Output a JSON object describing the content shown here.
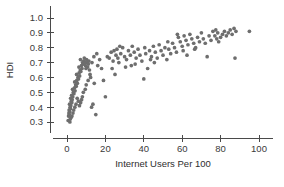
{
  "chart_data": {
    "type": "scatter",
    "title": "",
    "xlabel": "Internet Users Per 100",
    "ylabel": "HDI",
    "xlim": [
      -4,
      104
    ],
    "ylim": [
      0.28,
      1.04
    ],
    "xticks": [
      0,
      20,
      40,
      60,
      80,
      100
    ],
    "xticklabels": [
      "0",
      "20",
      "40",
      "60",
      "80",
      "100"
    ],
    "yticks": [
      0.3,
      0.4,
      0.5,
      0.6,
      0.7,
      0.8,
      0.9,
      1.0
    ],
    "yticklabels": [
      "0.3",
      "0.4",
      "0.5",
      "0.6",
      "0.7",
      "0.8",
      "0.9",
      "1.0"
    ],
    "grid": false,
    "legend": null,
    "marker": {
      "shape": "circle",
      "color": "#6e6e6e",
      "size": 2.6
    },
    "points": [
      [
        0.6,
        0.31
      ],
      [
        0.8,
        0.34
      ],
      [
        1.0,
        0.36
      ],
      [
        1.2,
        0.35
      ],
      [
        1.1,
        0.38
      ],
      [
        1.4,
        0.37
      ],
      [
        1.6,
        0.4
      ],
      [
        1.3,
        0.42
      ],
      [
        1.8,
        0.39
      ],
      [
        2.0,
        0.41
      ],
      [
        2.2,
        0.44
      ],
      [
        1.9,
        0.46
      ],
      [
        2.5,
        0.43
      ],
      [
        2.7,
        0.45
      ],
      [
        2.4,
        0.48
      ],
      [
        3.0,
        0.47
      ],
      [
        3.3,
        0.5
      ],
      [
        2.9,
        0.52
      ],
      [
        3.6,
        0.49
      ],
      [
        3.9,
        0.53
      ],
      [
        4.2,
        0.51
      ],
      [
        4.5,
        0.55
      ],
      [
        4.0,
        0.57
      ],
      [
        4.8,
        0.54
      ],
      [
        5.1,
        0.58
      ],
      [
        5.4,
        0.56
      ],
      [
        5.7,
        0.6
      ],
      [
        5.0,
        0.62
      ],
      [
        6.0,
        0.59
      ],
      [
        6.3,
        0.63
      ],
      [
        6.6,
        0.61
      ],
      [
        6.9,
        0.65
      ],
      [
        6.2,
        0.67
      ],
      [
        7.2,
        0.64
      ],
      [
        7.5,
        0.68
      ],
      [
        7.8,
        0.66
      ],
      [
        8.1,
        0.7
      ],
      [
        7.0,
        0.72
      ],
      [
        8.4,
        0.69
      ],
      [
        8.7,
        0.71
      ],
      [
        9.0,
        0.73
      ],
      [
        9.3,
        0.7
      ],
      [
        9.6,
        0.68
      ],
      [
        9.9,
        0.66
      ],
      [
        10.2,
        0.72
      ],
      [
        10.5,
        0.7
      ],
      [
        10.8,
        0.67
      ],
      [
        11.1,
        0.69
      ],
      [
        11.4,
        0.71
      ],
      [
        11.7,
        0.65
      ],
      [
        12.0,
        0.62
      ],
      [
        12.3,
        0.6
      ],
      [
        11.0,
        0.58
      ],
      [
        10.0,
        0.55
      ],
      [
        9.5,
        0.52
      ],
      [
        8.5,
        0.5
      ],
      [
        8.0,
        0.47
      ],
      [
        7.6,
        0.45
      ],
      [
        7.1,
        0.43
      ],
      [
        6.5,
        0.41
      ],
      [
        5.9,
        0.44
      ],
      [
        5.3,
        0.46
      ],
      [
        4.7,
        0.42
      ],
      [
        4.1,
        0.4
      ],
      [
        3.5,
        0.38
      ],
      [
        3.1,
        0.36
      ],
      [
        2.6,
        0.34
      ],
      [
        2.1,
        0.33
      ],
      [
        1.7,
        0.32
      ],
      [
        1.5,
        0.3
      ],
      [
        12.8,
        0.4
      ],
      [
        13.5,
        0.42
      ],
      [
        14.2,
        0.56
      ],
      [
        15.0,
        0.35
      ],
      [
        13.0,
        0.7
      ],
      [
        14.0,
        0.74
      ],
      [
        15.5,
        0.76
      ],
      [
        16.0,
        0.68
      ],
      [
        17.0,
        0.72
      ],
      [
        18.0,
        0.66
      ],
      [
        19.0,
        0.58
      ],
      [
        20.0,
        0.47
      ],
      [
        21.0,
        0.74
      ],
      [
        22.0,
        0.73
      ],
      [
        23.0,
        0.77
      ],
      [
        24.0,
        0.71
      ],
      [
        25.0,
        0.62
      ],
      [
        25.5,
        0.75
      ],
      [
        26.0,
        0.79
      ],
      [
        26.5,
        0.73
      ],
      [
        27.0,
        0.7
      ],
      [
        28.0,
        0.76
      ],
      [
        29.0,
        0.8
      ],
      [
        30.0,
        0.74
      ],
      [
        31.0,
        0.72
      ],
      [
        32.0,
        0.78
      ],
      [
        33.0,
        0.75
      ],
      [
        34.0,
        0.81
      ],
      [
        35.0,
        0.77
      ],
      [
        36.0,
        0.73
      ],
      [
        37.0,
        0.79
      ],
      [
        38.0,
        0.75
      ],
      [
        39.0,
        0.71
      ],
      [
        40.0,
        0.59
      ],
      [
        40.5,
        0.8
      ],
      [
        41.0,
        0.76
      ],
      [
        42.0,
        0.66
      ],
      [
        43.0,
        0.78
      ],
      [
        44.0,
        0.74
      ],
      [
        45.0,
        0.81
      ],
      [
        46.0,
        0.77
      ],
      [
        47.0,
        0.73
      ],
      [
        48.0,
        0.82
      ],
      [
        49.0,
        0.78
      ],
      [
        50.0,
        0.75
      ],
      [
        51.0,
        0.8
      ],
      [
        52.0,
        0.72
      ],
      [
        53.0,
        0.79
      ],
      [
        54.0,
        0.76
      ],
      [
        55.0,
        0.83
      ],
      [
        56.0,
        0.8
      ],
      [
        57.0,
        0.77
      ],
      [
        58.0,
        0.87
      ],
      [
        59.0,
        0.84
      ],
      [
        60.0,
        0.81
      ],
      [
        60.5,
        0.78
      ],
      [
        61.0,
        0.88
      ],
      [
        62.0,
        0.85
      ],
      [
        63.0,
        0.82
      ],
      [
        64.0,
        0.89
      ],
      [
        65.0,
        0.86
      ],
      [
        66.0,
        0.83
      ],
      [
        67.0,
        0.8
      ],
      [
        68.0,
        0.87
      ],
      [
        69.0,
        0.84
      ],
      [
        70.0,
        0.9
      ],
      [
        71.0,
        0.86
      ],
      [
        72.0,
        0.83
      ],
      [
        73.0,
        0.74
      ],
      [
        74.0,
        0.88
      ],
      [
        75.0,
        0.85
      ],
      [
        76.0,
        0.91
      ],
      [
        77.0,
        0.88
      ],
      [
        77.5,
        0.92
      ],
      [
        78.0,
        0.86
      ],
      [
        78.5,
        0.9
      ],
      [
        79.0,
        0.84
      ],
      [
        80.0,
        0.87
      ],
      [
        81.0,
        0.89
      ],
      [
        82.0,
        0.91
      ],
      [
        83.0,
        0.88
      ],
      [
        84.0,
        0.9
      ],
      [
        85.0,
        0.92
      ],
      [
        86.0,
        0.89
      ],
      [
        87.0,
        0.93
      ],
      [
        87.5,
        0.73
      ],
      [
        88.0,
        0.91
      ],
      [
        95.0,
        0.91
      ],
      [
        62.5,
        0.75
      ],
      [
        66.5,
        0.79
      ],
      [
        57.5,
        0.89
      ],
      [
        52.5,
        0.84
      ],
      [
        45.5,
        0.7
      ],
      [
        35.5,
        0.69
      ],
      [
        30.5,
        0.67
      ],
      [
        24.5,
        0.78
      ],
      [
        23.5,
        0.66
      ],
      [
        27.5,
        0.81
      ],
      [
        33.5,
        0.68
      ],
      [
        43.5,
        0.72
      ]
    ]
  }
}
